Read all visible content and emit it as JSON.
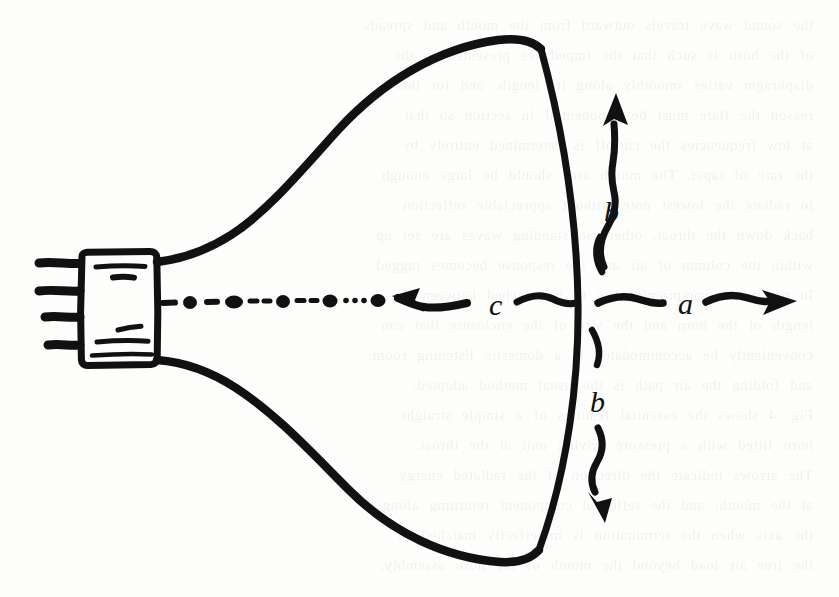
{
  "figure": {
    "medium": "hand-drawn ink sketch on paper",
    "ink_color": "#111111",
    "paper_color": "#fdfdfc",
    "width": 839,
    "height": 597
  },
  "labels": {
    "a": "a",
    "b_upper": "b",
    "b_lower": "b",
    "c": "c"
  },
  "annotations": [
    {
      "id": "a",
      "label": "a",
      "arrow": "wavy-arrow-right",
      "direction": "right",
      "position": "right of horn mouth, on the axis"
    },
    {
      "id": "b-upper",
      "label": "b",
      "arrow": "wavy-arrow-up",
      "direction": "up",
      "position": "above the axis, just outside the horn mouth"
    },
    {
      "id": "b-lower",
      "label": "b",
      "arrow": "wavy-arrow-down",
      "direction": "down",
      "position": "below the axis, just outside the horn mouth"
    },
    {
      "id": "c",
      "label": "c",
      "arrow": "wavy-arrow-left",
      "direction": "left",
      "position": "on the axis, pointing back into the horn throat"
    }
  ],
  "parts": [
    {
      "id": "driver-body",
      "name": "driver body",
      "shape": "rectangle",
      "note": "hand-drawn box at the throat"
    },
    {
      "id": "driver-terminals",
      "name": "terminal pins",
      "shape": "four horizontal prongs",
      "count": 4
    },
    {
      "id": "horn-upper-wall",
      "name": "upper horn wall",
      "shape": "exponential flare curve"
    },
    {
      "id": "horn-lower-wall",
      "name": "lower horn wall",
      "shape": "exponential flare curve"
    },
    {
      "id": "horn-mouth",
      "name": "horn mouth",
      "shape": "slightly bowed vertical arc"
    },
    {
      "id": "axis-line",
      "name": "acoustic axis",
      "shape": "dash-dot line with round dots"
    }
  ]
}
